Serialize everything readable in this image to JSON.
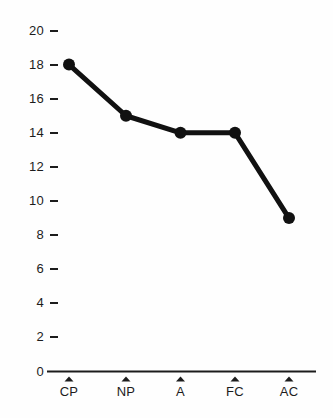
{
  "chart_data": {
    "type": "line",
    "title": "",
    "subtitle": "",
    "xlabel": "",
    "ylabel": "",
    "categories": [
      "CP",
      "NP",
      "A",
      "FC",
      "AC"
    ],
    "values": [
      18,
      15,
      14,
      14,
      9
    ],
    "series": [
      {
        "name": "",
        "values": [
          18,
          15,
          14,
          14,
          9
        ]
      }
    ],
    "ylim": [
      0,
      20
    ],
    "ytick_labels": [
      "0",
      "2",
      "4",
      "6",
      "8",
      "10",
      "12",
      "14",
      "16",
      "18",
      "20"
    ],
    "ytick_values": [
      0,
      2,
      4,
      6,
      8,
      10,
      12,
      14,
      16,
      18,
      20
    ],
    "xtick_labels": [
      "CP",
      "NP",
      "A",
      "FC",
      "AC"
    ],
    "grid": false,
    "legend": false,
    "legend_position": "none",
    "annotations": [],
    "colors": {
      "line": "#111111",
      "marker": "#111111",
      "axis": "#1c1c1c",
      "background": "#fefefe",
      "text": "#1c1c1c"
    },
    "marker_style": "filled-circle",
    "line_width": 5,
    "xtick_marker": "up-triangle"
  }
}
